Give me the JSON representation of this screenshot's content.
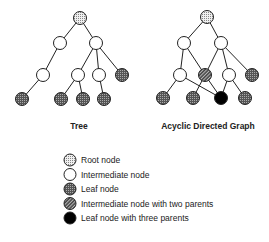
{
  "diagrams": {
    "tree": {
      "label": "Tree",
      "nodes": [
        {
          "id": "r",
          "type": "root",
          "x": 80,
          "y": 18
        },
        {
          "id": "a",
          "type": "intermediate",
          "x": 60,
          "y": 43
        },
        {
          "id": "b",
          "type": "intermediate",
          "x": 96,
          "y": 43
        },
        {
          "id": "c",
          "type": "intermediate",
          "x": 43,
          "y": 75
        },
        {
          "id": "d",
          "type": "intermediate",
          "x": 78,
          "y": 75
        },
        {
          "id": "e",
          "type": "intermediate",
          "x": 99,
          "y": 75
        },
        {
          "id": "f",
          "type": "leaf",
          "x": 122,
          "y": 75
        },
        {
          "id": "g",
          "type": "leaf",
          "x": 22,
          "y": 99
        },
        {
          "id": "h",
          "type": "leaf",
          "x": 61,
          "y": 99
        },
        {
          "id": "i",
          "type": "leaf",
          "x": 83,
          "y": 99
        },
        {
          "id": "j",
          "type": "leaf",
          "x": 104,
          "y": 99
        }
      ],
      "edges": [
        [
          "r",
          "a"
        ],
        [
          "r",
          "b"
        ],
        [
          "a",
          "c"
        ],
        [
          "b",
          "d"
        ],
        [
          "b",
          "e"
        ],
        [
          "b",
          "f"
        ],
        [
          "c",
          "g"
        ],
        [
          "d",
          "h"
        ],
        [
          "d",
          "i"
        ],
        [
          "e",
          "j"
        ]
      ]
    },
    "dag": {
      "label": "Acyclic Directed Graph",
      "nodes": [
        {
          "id": "r",
          "type": "root",
          "x": 207,
          "y": 17
        },
        {
          "id": "a",
          "type": "intermediate",
          "x": 184,
          "y": 43
        },
        {
          "id": "b",
          "type": "intermediate",
          "x": 221,
          "y": 43
        },
        {
          "id": "c",
          "type": "intermediate",
          "x": 180,
          "y": 75
        },
        {
          "id": "d",
          "type": "two-parents",
          "x": 205,
          "y": 75
        },
        {
          "id": "e",
          "type": "intermediate",
          "x": 229,
          "y": 75
        },
        {
          "id": "f",
          "type": "leaf",
          "x": 252,
          "y": 75
        },
        {
          "id": "g",
          "type": "leaf",
          "x": 163,
          "y": 98
        },
        {
          "id": "h",
          "type": "leaf",
          "x": 193,
          "y": 98
        },
        {
          "id": "k",
          "type": "three-parents",
          "x": 221,
          "y": 98
        },
        {
          "id": "j",
          "type": "leaf",
          "x": 245,
          "y": 98
        }
      ],
      "edges": [
        [
          "r",
          "a"
        ],
        [
          "r",
          "b"
        ],
        [
          "a",
          "c"
        ],
        [
          "a",
          "d"
        ],
        [
          "b",
          "d"
        ],
        [
          "b",
          "e"
        ],
        [
          "b",
          "f"
        ],
        [
          "c",
          "g"
        ],
        [
          "c",
          "k"
        ],
        [
          "d",
          "h"
        ],
        [
          "d",
          "k"
        ],
        [
          "e",
          "k"
        ],
        [
          "e",
          "j"
        ]
      ]
    }
  },
  "legend": {
    "items": [
      {
        "type": "root",
        "label": "Root node"
      },
      {
        "type": "intermediate",
        "label": "Intermediate node"
      },
      {
        "type": "leaf",
        "label": "Leaf node"
      },
      {
        "type": "two-parents",
        "label": "Intermediate node with two parents"
      },
      {
        "type": "three-parents",
        "label": "Leaf node with three parents"
      }
    ]
  },
  "colors": {
    "line": "#222222",
    "root_fill": "#d8d8d8",
    "leaf_fill": "#7a7a7a",
    "two_parent_fill": "#6a6a6a",
    "three_parent_fill": "#000000"
  }
}
